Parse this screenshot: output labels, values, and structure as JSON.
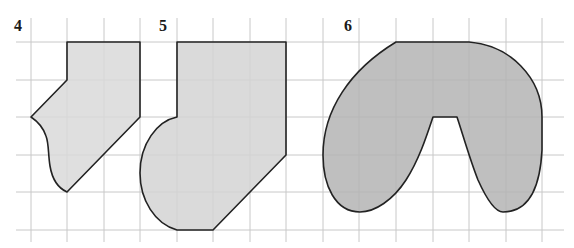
{
  "figure": {
    "grid": {
      "color": "#c8c8c8",
      "vertical_x": [
        31,
        67,
        104,
        140,
        177,
        213,
        250,
        286,
        323,
        359,
        396,
        433,
        469,
        506,
        542
      ],
      "horizontal_y": [
        42,
        80,
        117,
        155,
        192,
        230
      ],
      "x_extent": [
        16,
        564
      ],
      "y_extent": [
        18,
        242
      ]
    },
    "shapes": [
      {
        "id": "4",
        "label": "4",
        "fill": "#d9d9d9",
        "label_pos": [
          14,
          31
        ]
      },
      {
        "id": "5",
        "label": "5",
        "fill": "#d4d4d4",
        "label_pos": [
          159,
          31
        ]
      },
      {
        "id": "6",
        "label": "6",
        "fill": "#b4b4b4",
        "label_pos": [
          344,
          31
        ]
      }
    ],
    "outline_color": "#222222"
  }
}
